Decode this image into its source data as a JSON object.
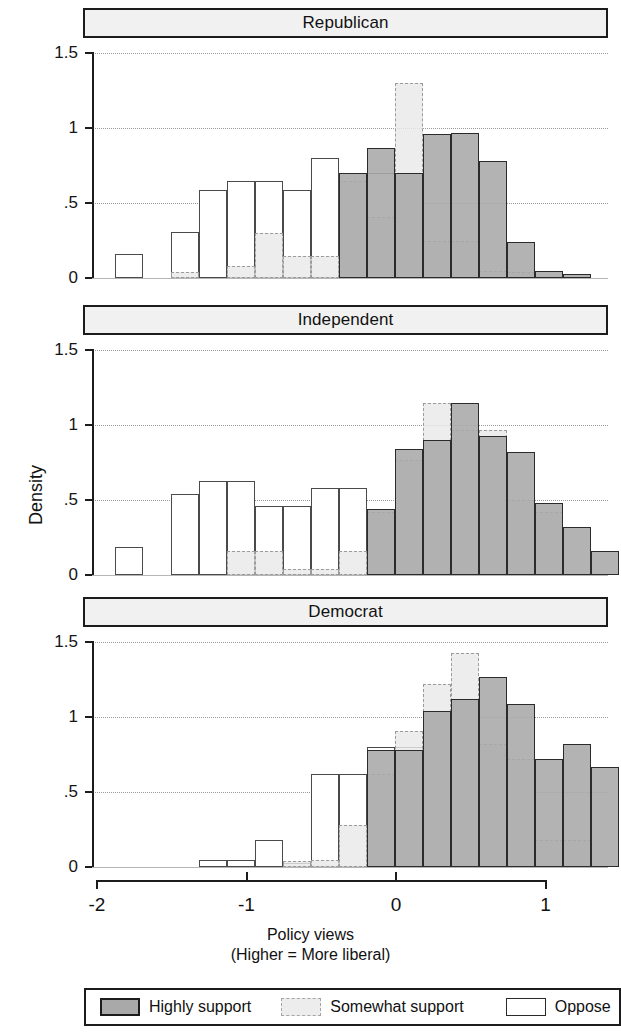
{
  "figure": {
    "y_axis_title": "Density",
    "x_axis_title_line1": "Policy views",
    "x_axis_title_line2": "(Higher = More liberal)"
  },
  "axes": {
    "y_ticks": [
      "1.5",
      "1",
      ".5",
      "0"
    ],
    "y_tick_values": [
      1.5,
      1.0,
      0.5,
      0.0
    ],
    "x_ticks": [
      "-2",
      "-1",
      "0",
      "1"
    ],
    "x_tick_values": [
      -2,
      -1,
      0,
      1
    ],
    "xlim": [
      -2.05,
      1.4
    ],
    "ylim": [
      0,
      1.5
    ]
  },
  "legend": {
    "items": [
      {
        "label": "Highly support",
        "style": "highly",
        "color": "#a9a9a9"
      },
      {
        "label": "Somewhat support",
        "style": "somewhat",
        "color": "#ededed"
      },
      {
        "label": "Oppose",
        "style": "oppose",
        "color": "#ffffff"
      }
    ]
  },
  "panels": [
    {
      "title": "Republican"
    },
    {
      "title": "Independent"
    },
    {
      "title": "Democrat"
    }
  ],
  "chart_data": {
    "type": "bar",
    "subtype": "overlaid-histogram",
    "title": "",
    "xlabel": "Policy views (Higher = More liberal)",
    "ylabel": "Density",
    "xlim": [
      -2.05,
      1.4
    ],
    "ylim": [
      0,
      1.5
    ],
    "grid": true,
    "grid_axis": "y",
    "legend_position": "bottom",
    "bin_width": 0.1875,
    "panels": [
      {
        "name": "Republican",
        "series": [
          {
            "name": "Oppose",
            "bins": [
              -1.875,
              -1.6875,
              -1.5,
              -1.3125,
              -1.125,
              -0.9375,
              -0.75,
              -0.5625,
              -0.375,
              -0.1875,
              0,
              0.1875,
              0.375
            ],
            "values": [
              0.16,
              0.0,
              0.31,
              0.59,
              0.65,
              0.65,
              0.59,
              0.8,
              0.7,
              0.7,
              0.7,
              0.0,
              0.0
            ]
          },
          {
            "name": "Somewhat support",
            "bins": [
              -1.5,
              -1.3125,
              -1.125,
              -0.9375,
              -0.75,
              -0.5625,
              -0.375,
              -0.1875,
              0,
              0.1875,
              0.375,
              0.5625,
              0.75
            ],
            "values": [
              0.04,
              0.0,
              0.08,
              0.3,
              0.15,
              0.15,
              0.65,
              0.41,
              1.3,
              0.25,
              0.25,
              0.05,
              0.04
            ]
          },
          {
            "name": "Highly support",
            "bins": [
              -0.5625,
              -0.375,
              -0.1875,
              0,
              0.1875,
              0.375,
              0.5625,
              0.75,
              0.9375,
              1.125
            ],
            "values": [
              0.0,
              0.7,
              0.87,
              0.7,
              0.96,
              0.97,
              0.78,
              0.24,
              0.05,
              0.03
            ]
          }
        ]
      },
      {
        "name": "Independent",
        "series": [
          {
            "name": "Oppose",
            "bins": [
              -1.875,
              -1.6875,
              -1.5,
              -1.3125,
              -1.125,
              -0.9375,
              -0.75,
              -0.5625,
              -0.375,
              -0.1875,
              0,
              0.1875
            ],
            "values": [
              0.19,
              0.0,
              0.54,
              0.63,
              0.63,
              0.46,
              0.46,
              0.58,
              0.58,
              0.0,
              0.0,
              0.0
            ]
          },
          {
            "name": "Somewhat support",
            "bins": [
              -1.125,
              -0.9375,
              -0.75,
              -0.5625,
              -0.375,
              -0.1875,
              0,
              0.1875,
              0.375,
              0.5625,
              0.75,
              0.9375
            ],
            "values": [
              0.16,
              0.16,
              0.04,
              0.04,
              0.16,
              0.42,
              0.77,
              1.15,
              0.97,
              0.97,
              0.5,
              0.42
            ]
          },
          {
            "name": "Highly support",
            "bins": [
              -0.375,
              -0.1875,
              0,
              0.1875,
              0.375,
              0.5625,
              0.75,
              0.9375,
              1.125,
              1.3125
            ],
            "values": [
              0.0,
              0.44,
              0.84,
              0.9,
              1.15,
              0.93,
              0.82,
              0.48,
              0.32,
              0.16
            ]
          }
        ]
      },
      {
        "name": "Democrat",
        "series": [
          {
            "name": "Oppose",
            "bins": [
              -1.3125,
              -1.125,
              -0.9375,
              -0.75,
              -0.5625,
              -0.375,
              -0.1875,
              0,
              0.1875
            ],
            "values": [
              0.05,
              0.05,
              0.18,
              0.03,
              0.62,
              0.62,
              0.8,
              0.8,
              0.0
            ]
          },
          {
            "name": "Somewhat support",
            "bins": [
              -0.75,
              -0.5625,
              -0.375,
              -0.1875,
              0,
              0.1875,
              0.375,
              0.5625,
              0.75,
              0.9375,
              1.125
            ],
            "values": [
              0.04,
              0.05,
              0.28,
              0.62,
              0.91,
              1.22,
              1.43,
              0.82,
              0.72,
              0.18,
              0.18
            ]
          },
          {
            "name": "Highly support",
            "bins": [
              -0.375,
              -0.1875,
              0,
              0.1875,
              0.375,
              0.5625,
              0.75,
              0.9375,
              1.125,
              1.3125
            ],
            "values": [
              0.0,
              0.78,
              0.78,
              1.04,
              1.12,
              1.27,
              1.09,
              0.72,
              0.82,
              0.67
            ]
          }
        ]
      }
    ]
  }
}
